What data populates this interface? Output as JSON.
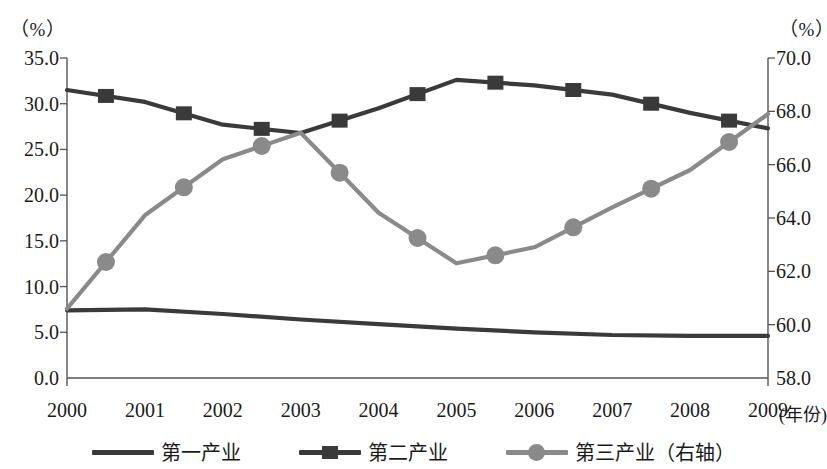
{
  "chart_data": {
    "type": "line",
    "title": "",
    "xlabel": "(年份)",
    "ylabel": "（%）",
    "y2label": "（%）",
    "x": [
      "2000",
      "2001",
      "2002",
      "2003",
      "2004",
      "2005",
      "2006",
      "2007",
      "2008",
      "2009"
    ],
    "categories": [
      "2000",
      "2001",
      "2002",
      "2003",
      "2004",
      "2005",
      "2006",
      "2007",
      "2008",
      "2009"
    ],
    "ylim": [
      0.0,
      35.0
    ],
    "y2lim": [
      58.0,
      70.0
    ],
    "yticks": [
      "0.0",
      "5.0",
      "10.0",
      "15.0",
      "20.0",
      "25.0",
      "30.0",
      "35.0"
    ],
    "y2ticks": [
      "58.0",
      "60.0",
      "62.0",
      "64.0",
      "66.0",
      "68.0",
      "70.0"
    ],
    "grid": false,
    "legend_position": "bottom",
    "series": [
      {
        "name": "第一产业",
        "axis": "left",
        "color": "#3a3a3a",
        "marker": "none",
        "values": [
          7.4,
          7.5,
          7.0,
          6.4,
          5.9,
          5.4,
          5.0,
          4.7,
          4.6,
          4.6
        ]
      },
      {
        "name": "第二产业",
        "axis": "left",
        "color": "#3a3a3a",
        "marker": "square",
        "values": [
          31.5,
          30.2,
          27.7,
          26.8,
          29.5,
          32.6,
          32.0,
          31.0,
          29.0,
          27.3
        ]
      },
      {
        "name": "第三产业（右轴）",
        "axis": "right",
        "color": "#8a8a8a",
        "marker": "circle",
        "values": [
          60.6,
          64.1,
          66.2,
          67.2,
          64.2,
          62.3,
          62.9,
          64.4,
          65.8,
          67.9
        ]
      }
    ]
  },
  "axes": {
    "left_unit": "（%）",
    "right_unit": "（%）",
    "x_unit": "(年份)",
    "left_ticks": [
      "35.0",
      "30.0",
      "25.0",
      "20.0",
      "15.0",
      "10.0",
      "5.0",
      "0.0"
    ],
    "right_ticks": [
      "70.0",
      "68.0",
      "66.0",
      "64.0",
      "62.0",
      "60.0",
      "58.0"
    ],
    "x_ticks": [
      "2000",
      "2001",
      "2002",
      "2003",
      "2004",
      "2005",
      "2006",
      "2007",
      "2008",
      "2009"
    ]
  },
  "legend": {
    "items": [
      {
        "label": "第一产业",
        "marker": "line",
        "color": "#3a3a3a"
      },
      {
        "label": "第二产业",
        "marker": "square",
        "color": "#3a3a3a"
      },
      {
        "label": "第三产业（右轴）",
        "marker": "circle",
        "color": "#8a8a8a"
      }
    ]
  }
}
